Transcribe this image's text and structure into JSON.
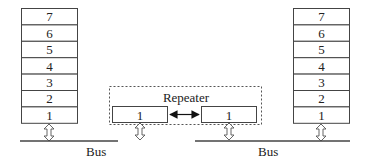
{
  "diagram": {
    "left_stack": {
      "layers": [
        "7",
        "6",
        "5",
        "4",
        "3",
        "2",
        "1"
      ]
    },
    "right_stack": {
      "layers": [
        "7",
        "6",
        "5",
        "4",
        "3",
        "2",
        "1"
      ]
    },
    "repeater": {
      "label": "Repeater",
      "left_port": "1",
      "right_port": "1",
      "link": "bidirectional-arrow"
    },
    "left_bus": {
      "label": "Bus"
    },
    "right_bus": {
      "label": "Bus"
    },
    "icons": {
      "stack_bus_connector": "hollow-double-arrow-vertical",
      "repeater_link": "solid-double-arrow-horizontal"
    }
  }
}
